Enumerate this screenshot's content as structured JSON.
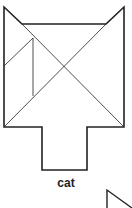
{
  "figure": {
    "caption": "cat",
    "stroke_color": "#222222",
    "background": "#ffffff",
    "outline": [
      [
        4,
        7
      ],
      [
        22,
        24
      ],
      [
        106,
        24
      ],
      [
        124,
        7
      ],
      [
        124,
        127
      ],
      [
        87,
        127
      ],
      [
        87,
        170
      ],
      [
        42,
        170
      ],
      [
        42,
        127
      ],
      [
        4,
        127
      ]
    ],
    "inner_lines": [
      [
        [
          22,
          24
        ],
        [
          124,
          127
        ]
      ],
      [
        [
          106,
          24
        ],
        [
          4,
          127
        ]
      ],
      [
        [
          33,
          38
        ],
        [
          33,
          96
        ]
      ],
      [
        [
          33,
          38
        ],
        [
          4,
          66
        ]
      ]
    ],
    "partial_shape": [
      [
        107,
        208
      ],
      [
        107,
        190
      ],
      [
        132,
        208
      ]
    ]
  }
}
